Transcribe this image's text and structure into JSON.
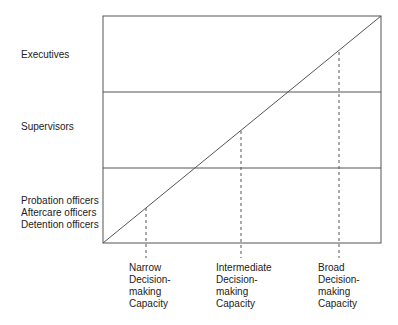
{
  "diagram": {
    "type": "decision-making-capacity-by-rank",
    "levels": [
      {
        "id": "executives",
        "lines": [
          "Executives"
        ]
      },
      {
        "id": "supervisors",
        "lines": [
          "Supervisors"
        ]
      },
      {
        "id": "line-officers",
        "lines": [
          "Probation officers",
          "Aftercare officers",
          "Detention officers"
        ]
      }
    ],
    "capacities": [
      {
        "id": "narrow",
        "lines": [
          "Narrow",
          "Decision-",
          "making",
          "Capacity"
        ]
      },
      {
        "id": "intermediate",
        "lines": [
          "Intermediate",
          "Decision-",
          "making",
          "Capacity"
        ]
      },
      {
        "id": "broad",
        "lines": [
          "Broad",
          "Decision-",
          "making",
          "Capacity"
        ]
      }
    ],
    "colors": {
      "line": "#555555",
      "text": "#222222",
      "background": "#ffffff"
    }
  }
}
